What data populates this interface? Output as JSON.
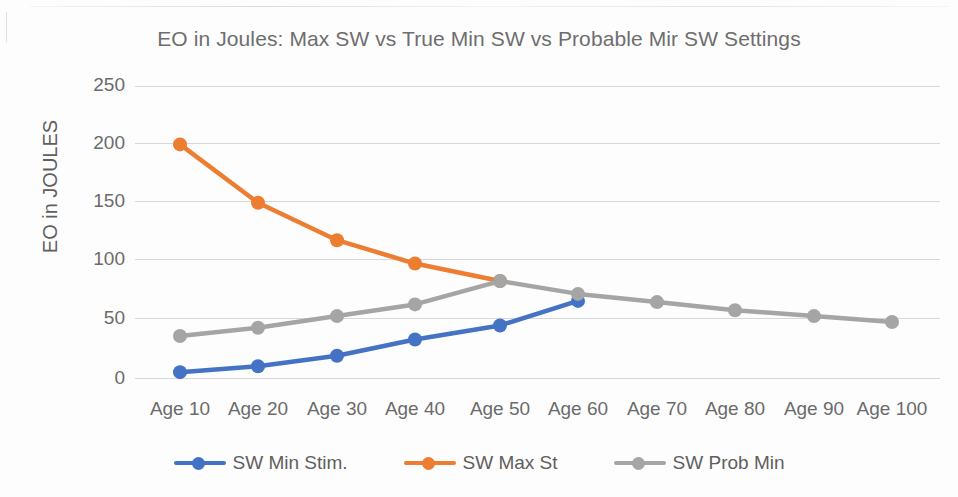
{
  "chart_data": {
    "type": "line",
    "title": "EO in Joules: Max SW vs True Min SW vs Probable Mir SW Settings",
    "xlabel": "",
    "ylabel": "EO in JOULES",
    "categories": [
      "Age 10",
      "Age 20",
      "Age 30",
      "Age 40",
      "Age 50",
      "Age 60",
      "Age 70",
      "Age 80",
      "Age 90",
      "Age 100"
    ],
    "yticks": [
      0,
      50,
      100,
      150,
      200,
      250
    ],
    "ylim": [
      0,
      250
    ],
    "grid": true,
    "legend_position": "bottom",
    "series": [
      {
        "name": "SW Min Stim.",
        "color": "#4472C4",
        "values": [
          5,
          10,
          19,
          33,
          45,
          66,
          null,
          null,
          null,
          null
        ]
      },
      {
        "name": "SW Max St",
        "color": "#ED7D31",
        "values": [
          200,
          150,
          118,
          98,
          83,
          null,
          null,
          null,
          null,
          null
        ]
      },
      {
        "name": "SW Prob Min",
        "color": "#A5A5A5",
        "values": [
          36,
          43,
          53,
          63,
          83,
          72,
          65,
          58,
          53,
          48
        ]
      }
    ]
  },
  "axis_text_color": "#6b6b6b",
  "title_text_color": "#6e6e6e"
}
